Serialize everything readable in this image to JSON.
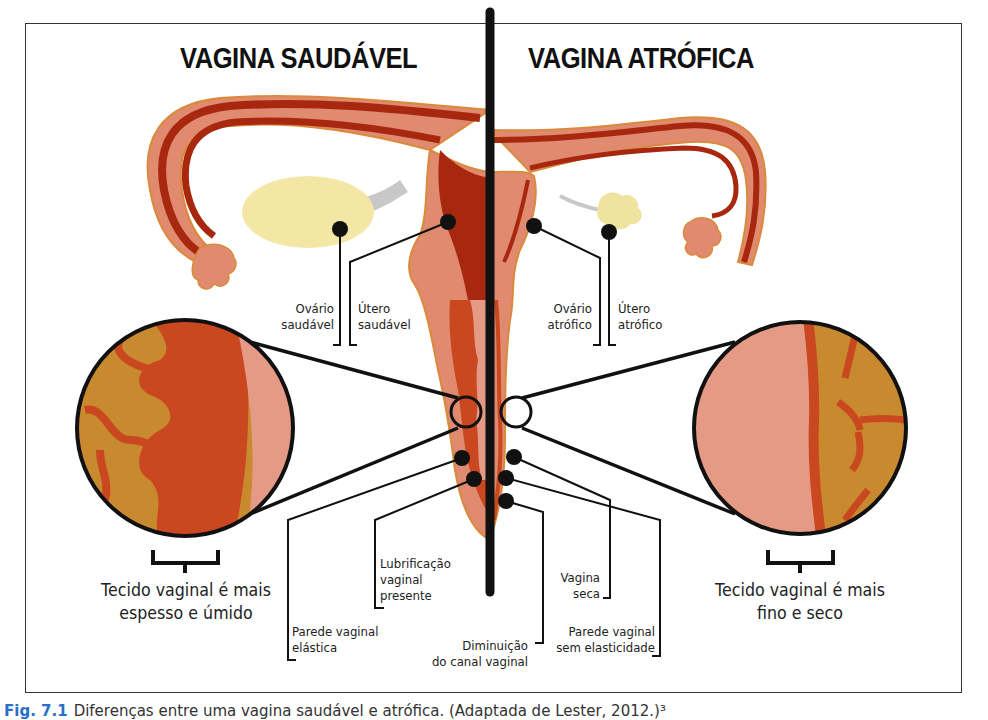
{
  "titles": {
    "left": "VAGINA SAUDÁVEL",
    "right": "VAGINA ATRÓFICA"
  },
  "labels": {
    "ovario_saudavel": [
      "Ovário",
      "saudável"
    ],
    "utero_saudavel": [
      "Útero",
      "saudável"
    ],
    "ovario_atrofico": [
      "Ovário",
      "atrófico"
    ],
    "utero_atrofico": [
      "Útero",
      "atrófico"
    ],
    "lubrificacao": [
      "Lubrificação",
      "vaginal",
      "presente"
    ],
    "parede_elastica": [
      "Parede vaginal",
      "elástica"
    ],
    "diminuicao": [
      "Diminuição",
      "do canal vaginal"
    ],
    "vagina_seca": [
      "Vagina",
      "seca"
    ],
    "parede_sem_elasticidade": [
      "Parede vaginal",
      "sem elasticidade"
    ],
    "tecido_saudavel": [
      "Tecido vaginal é mais",
      "espesso e úmido"
    ],
    "tecido_atrofico": [
      "Tecido vaginal é mais",
      "fino e seco"
    ]
  },
  "caption": {
    "fig_label": "Fig. 7.1",
    "text": "Diferenças entre uma vagina saudável e atrófica. (Adaptada de Lester, 2012.)³"
  },
  "colors": {
    "outline": "#d98a3a",
    "tissue": "#e08a70",
    "dark_red": "#a8280f",
    "mid_red": "#c9481f",
    "ovary_healthy": "#f4e7a6",
    "ovary_atrophic": "#efe3a0",
    "ligament": "#c8c8c8",
    "stroma": "#c8892f",
    "caption_blue": "#2a6fc9"
  }
}
